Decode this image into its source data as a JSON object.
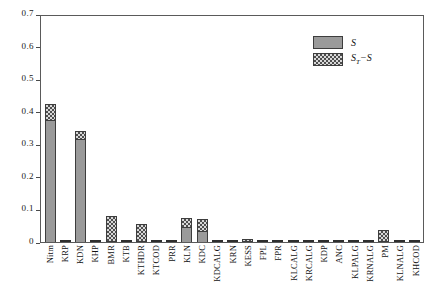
{
  "chart_data": {
    "type": "bar",
    "subtype": "stacked-bar",
    "title": "",
    "xlabel": "",
    "ylabel": "",
    "ylim": [
      0,
      0.7
    ],
    "ytick_labels": [
      "0.7",
      "0.6",
      "0.5",
      "0.4",
      "0.3",
      "0.2",
      "0.1",
      "0"
    ],
    "ytick_values": [
      0.7,
      0.6,
      0.5,
      0.4,
      0.3,
      0.2,
      0.1,
      0
    ],
    "grid": false,
    "legend_position": "top-right",
    "legend": [
      {
        "name": "S",
        "pattern": "solid-gray"
      },
      {
        "name": "ST-S",
        "pattern": "checkered-hatch"
      }
    ],
    "categories": [
      "Nitm",
      "KRP",
      "KDN",
      "KHP",
      "BMR",
      "KTB",
      "KTHDR",
      "KTCOD",
      "PRR",
      "KLN",
      "KDC",
      "KDCALG",
      "KRN",
      "KESS",
      "FPL",
      "FPR",
      "KLCALG",
      "KRCALG",
      "KDP",
      "ANC",
      "KLPALG",
      "KRNALG",
      "PM",
      "KLNALG",
      "KHCOD"
    ],
    "series": [
      {
        "name": "S",
        "values": [
          0.375,
          0.0,
          0.315,
          0.0,
          0.0,
          0.0,
          0.0,
          0.0,
          0.0,
          0.047,
          0.035,
          0.0,
          0.0,
          0.0,
          0.0,
          0.0,
          0.0,
          0.0,
          0.0,
          0.0,
          0.0,
          0.0,
          0.0,
          0.0,
          0.0
        ]
      },
      {
        "name": "ST-S",
        "values": [
          0.05,
          0.0,
          0.025,
          0.0,
          0.08,
          0.0,
          0.055,
          0.0,
          0.0,
          0.028,
          0.035,
          0.0,
          0.0,
          0.01,
          0.0,
          0.0,
          0.0,
          0.0,
          0.0,
          0.0,
          0.0,
          0.0,
          0.038,
          0.0,
          0.0
        ]
      }
    ],
    "totals": [
      0.425,
      0.0,
      0.34,
      0.0,
      0.08,
      0.0,
      0.055,
      0.0,
      0.0,
      0.075,
      0.07,
      0.0,
      0.0,
      0.01,
      0.0,
      0.0,
      0.0,
      0.0,
      0.0,
      0.0,
      0.0,
      0.0,
      0.038,
      0.0,
      0.0
    ]
  },
  "legend": {
    "entries": [
      {
        "label": "S",
        "sub": "",
        "tail": ""
      },
      {
        "label": "S",
        "sub": "T",
        "tail": "−S"
      }
    ]
  },
  "colors": {
    "bar_solid": "#9a9a9a",
    "bar_hatch_bg": "#d8d8d8",
    "bar_hatch_fg": "#4e4e4e",
    "axis": "#5a5a5a",
    "text": "#111111"
  }
}
